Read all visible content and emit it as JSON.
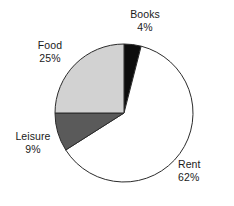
{
  "chart_data": {
    "type": "pie",
    "title": "",
    "subtitle": "",
    "xlabel": "",
    "ylabel": "",
    "grid": false,
    "legend_position": "none",
    "label_format": "name and percent",
    "start_angle_deg": 0,
    "direction": "clockwise",
    "categories": [
      "Books",
      "Rent",
      "Leisure",
      "Food"
    ],
    "values": [
      4,
      62,
      9,
      25
    ],
    "units": "%",
    "slices": [
      {
        "name": "Books",
        "value": 4,
        "value_text": "4%",
        "color": "#0d0d0d",
        "edge_color": "#2b2b2b"
      },
      {
        "name": "Rent",
        "value": 62,
        "value_text": "62%",
        "color": "#ffffff",
        "edge_color": "#2b2b2b"
      },
      {
        "name": "Leisure",
        "value": 9,
        "value_text": "9%",
        "color": "#5a5a5a",
        "edge_color": "#2b2b2b"
      },
      {
        "name": "Food",
        "value": 25,
        "value_text": "25%",
        "color": "#d2d2d2",
        "edge_color": "#2b2b2b"
      }
    ]
  },
  "labels": {
    "books": {
      "name": "Books",
      "value": "4%"
    },
    "food": {
      "name": "Food",
      "value": "25%"
    },
    "leisure": {
      "name": "Leisure",
      "value": "9%"
    },
    "rent": {
      "name": "Rent",
      "value": "62%"
    }
  }
}
